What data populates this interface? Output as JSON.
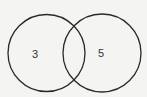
{
  "diagram": {
    "type": "venn",
    "sets": [
      {
        "id": "left",
        "label": "3",
        "cx": 46.5,
        "cy": 53,
        "r": 38.5
      },
      {
        "id": "right",
        "label": "5",
        "cx": 102,
        "cy": 53,
        "r": 39
      }
    ],
    "intersection_label": "",
    "stroke_color": "#2a2a2a",
    "background_color": "#f4f4f2"
  }
}
